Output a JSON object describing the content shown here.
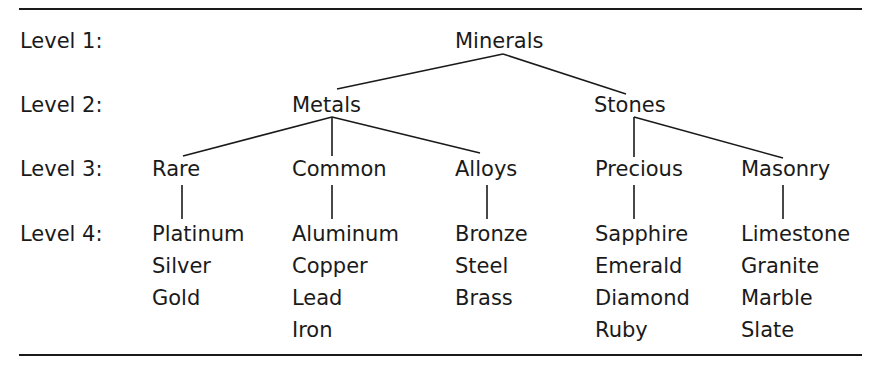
{
  "levels": [
    "Level 1:",
    "Level 2:",
    "Level 3:",
    "Level 4:"
  ],
  "tree": {
    "root": "Minerals",
    "level2": [
      "Metals",
      "Stones"
    ],
    "level3": [
      "Rare",
      "Common",
      "Alloys",
      "Precious",
      "Masonry"
    ],
    "level4": {
      "rare": [
        "Platinum",
        "Silver",
        "Gold"
      ],
      "common": [
        "Aluminum",
        "Copper",
        "Lead",
        "Iron"
      ],
      "alloys": [
        "Bronze",
        "Steel",
        "Brass"
      ],
      "precious": [
        "Sapphire",
        "Emerald",
        "Diamond",
        "Ruby"
      ],
      "masonry": [
        "Limestone",
        "Granite",
        "Marble",
        "Slate"
      ]
    }
  }
}
